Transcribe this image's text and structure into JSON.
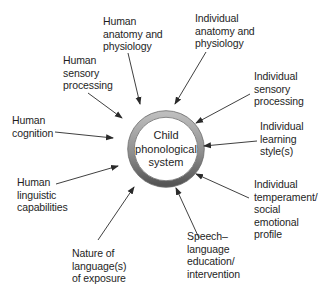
{
  "diagram": {
    "center": {
      "label": "Child\nphonological\nsystem"
    },
    "factors": [
      {
        "id": "human-anatomy",
        "label": "Human\nanatomy and\nphysiology"
      },
      {
        "id": "individual-anatomy",
        "label": "Individual\nanatomy and\nphysiology"
      },
      {
        "id": "human-sensory",
        "label": "Human\nsensory\nprocessing"
      },
      {
        "id": "individual-sensory",
        "label": "Individual\nsensory\nprocessing"
      },
      {
        "id": "human-cognition",
        "label": "Human\ncognition"
      },
      {
        "id": "individual-learning",
        "label": "Individual\nlearning\nstyle(s)"
      },
      {
        "id": "human-linguistic",
        "label": "Human\nlinguistic\ncapabilities"
      },
      {
        "id": "individual-temperament",
        "label": "Individual\ntemperament/\nsocial\nemotional\nprofile"
      },
      {
        "id": "nature-of-language",
        "label": "Nature of\nlanguage(s)\nof exposure"
      },
      {
        "id": "speech-language-education",
        "label": "Speech–\nlanguage\neducation/\nintervention"
      }
    ],
    "colors": {
      "text": "#1e1e1e",
      "arrow": "#2a2a2a",
      "ring_light": "#b5b5b5",
      "ring_dark": "#5a5a5a",
      "background": "#ffffff"
    }
  }
}
